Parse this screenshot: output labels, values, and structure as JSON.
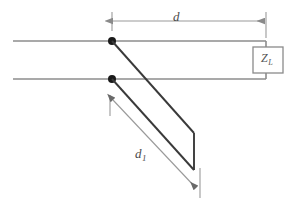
{
  "figure": {
    "kind": "transmission-line-stub-matching-diagram",
    "background_color": "#ffffff",
    "width": 290,
    "height": 211,
    "labels": {
      "distance_to_load": "d",
      "stub_length_base": "d",
      "stub_length_subscript": "1",
      "load_impedance_base": "Z",
      "load_impedance_subscript": "L"
    },
    "colors": {
      "main_line": "#8c8c8c",
      "stub_line": "#3a3a3a",
      "dimension_line": "#9a9a9a",
      "node_dot": "#1a1a1a",
      "load_box_stroke": "#8a8a8a",
      "label_text": "#4a4a4a"
    },
    "geometry": {
      "top_line_y": 41,
      "bottom_line_y": 79,
      "line_left_x": 13,
      "line_right_x": 266,
      "node_x": 112,
      "node_radius": 4,
      "load_box": {
        "x": 253,
        "y": 47,
        "width": 30,
        "height": 26
      },
      "d_dimension": {
        "y": 21,
        "x_start": 112,
        "x_end": 266
      },
      "stub_end_cap": {
        "x": 194,
        "y_top": 133,
        "y_bottom": 170
      },
      "d1_dimension": {
        "x_start": 113,
        "y_start": 100,
        "x_end": 196,
        "y_end": 188
      }
    }
  }
}
